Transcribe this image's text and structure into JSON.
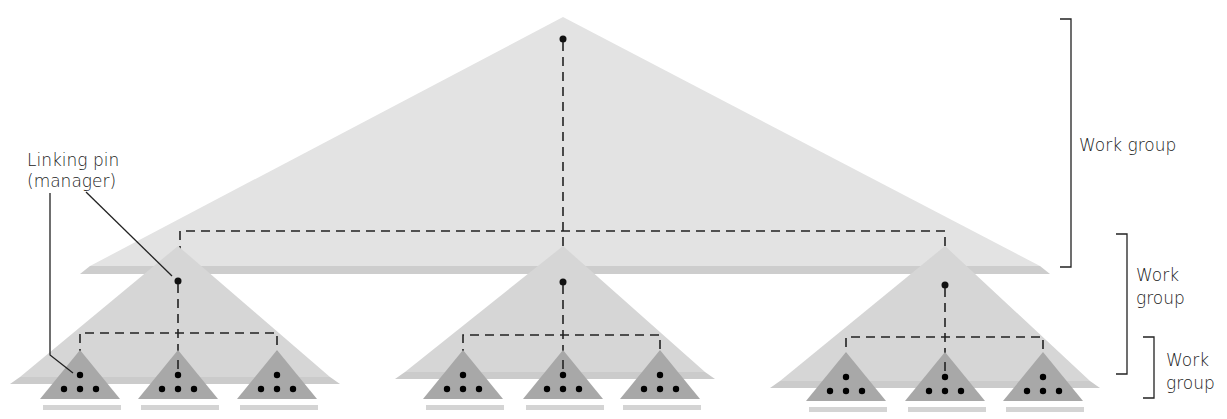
{
  "diagram": {
    "labels": {
      "linking_pin": "Linking pin",
      "linking_pin_sub": "(manager)",
      "work_group_top": "Work group",
      "work_group_mid_line1": "Work",
      "work_group_mid_line2": "group",
      "work_group_bottom_line1": "Work",
      "work_group_bottom_line2": "group"
    },
    "levels": [
      {
        "name": "top",
        "triangles": 1,
        "members_per_triangle": 1
      },
      {
        "name": "middle",
        "triangles": 3,
        "members_per_triangle": 1
      },
      {
        "name": "bottom",
        "triangles": 9,
        "members_per_triangle": 4
      }
    ],
    "colors": {
      "top_fill": "#e2e2e2",
      "top_shadow": "#cfcfcf",
      "mid_fill": "#d6d6d6",
      "mid_shadow": "#cacaca",
      "low_fill": "#a9a9a9",
      "low_shadow": "#d0d0d0",
      "line": "#222222"
    }
  }
}
